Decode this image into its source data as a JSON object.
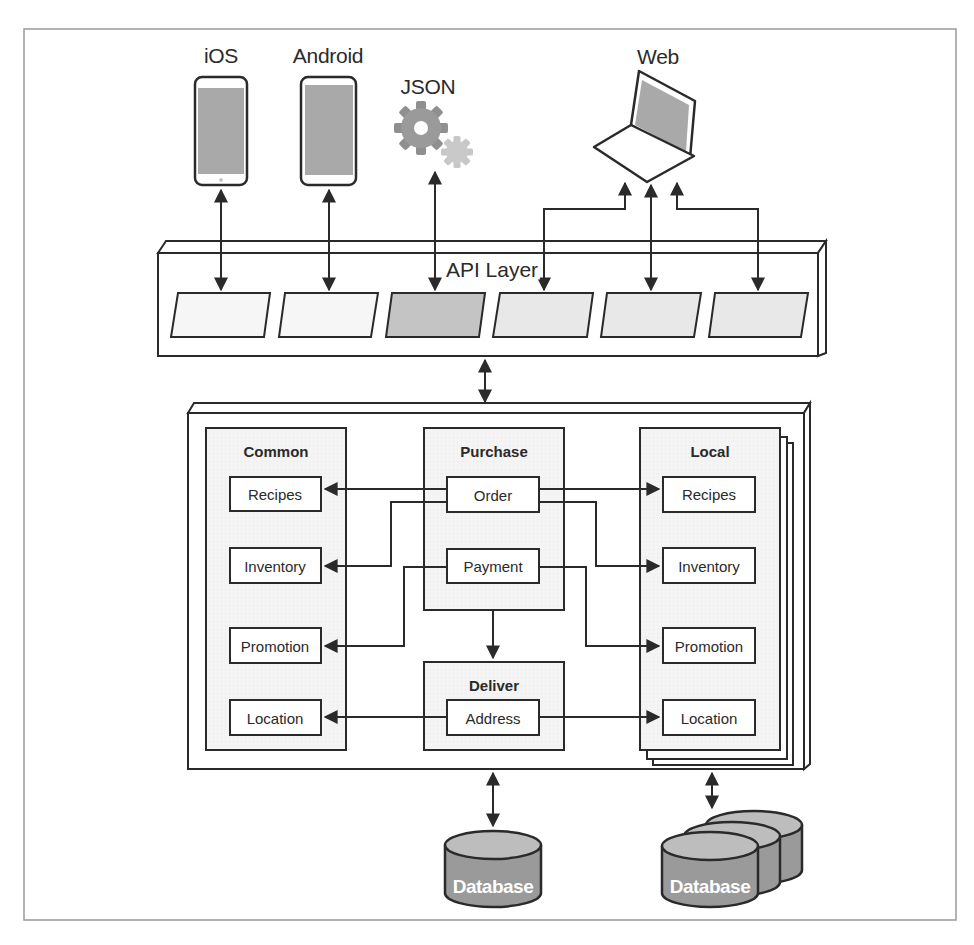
{
  "diagram": {
    "type": "architecture",
    "clients": [
      {
        "id": "ios",
        "label": "iOS",
        "icon": "smartphone-icon"
      },
      {
        "id": "android",
        "label": "Android",
        "icon": "smartphone-icon"
      },
      {
        "id": "json",
        "label": "JSON",
        "icon": "gears-icon"
      },
      {
        "id": "web",
        "label": "Web",
        "icon": "laptop-icon"
      }
    ],
    "api_layer": {
      "label": "API Layer",
      "slots": 6,
      "highlighted_slot": 3
    },
    "services": {
      "common": {
        "title": "Common",
        "items": [
          "Recipes",
          "Inventory",
          "Promotion",
          "Location"
        ]
      },
      "purchase": {
        "title": "Purchase",
        "items": [
          "Order",
          "Payment"
        ]
      },
      "deliver": {
        "title": "Deliver",
        "items": [
          "Address"
        ]
      },
      "local": {
        "title": "Local",
        "items": [
          "Recipes",
          "Inventory",
          "Promotion",
          "Location"
        ]
      }
    },
    "databases": [
      {
        "id": "db-shared",
        "label": "Database",
        "stacked": false
      },
      {
        "id": "db-local",
        "label": "Database",
        "stacked": true
      }
    ],
    "connections": [
      {
        "from": "Order",
        "to": "Common.Recipes"
      },
      {
        "from": "Order",
        "to": "Common.Inventory"
      },
      {
        "from": "Order",
        "to": "Local.Recipes"
      },
      {
        "from": "Order",
        "to": "Local.Inventory"
      },
      {
        "from": "Payment",
        "to": "Common.Promotion"
      },
      {
        "from": "Payment",
        "to": "Local.Promotion"
      },
      {
        "from": "Purchase",
        "to": "Deliver"
      },
      {
        "from": "Address",
        "to": "Common.Location"
      },
      {
        "from": "Address",
        "to": "Local.Location"
      }
    ]
  },
  "colors": {
    "stroke": "#2a2a2a",
    "panel_fill": "#f3f3f3",
    "device_screen": "#a9a9a9",
    "api_slot_light": "#f4f4f4",
    "api_slot_mid": "#e6e6e6",
    "api_slot_dark": "#c4c4c4",
    "database_fill": "#9a9a9a",
    "database_top": "#bdbdbd"
  }
}
